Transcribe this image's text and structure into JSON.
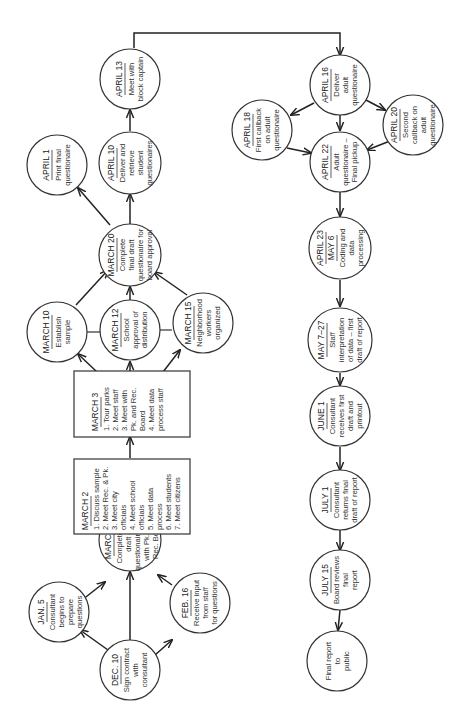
{
  "nodes": {
    "dec10": {
      "date": "DEC. 10",
      "lines": [
        "Sign contract",
        "with",
        "consultant"
      ]
    },
    "jan5": {
      "date": "JAN. 5",
      "lines": [
        "Consultant",
        "begins to",
        "prepare",
        "questions"
      ]
    },
    "feb16": {
      "date": "FEB. 16",
      "lines": [
        "Receive input",
        "from staff",
        "for questions"
      ]
    },
    "march1": {
      "date": "MARCH 1",
      "lines": [
        "Complete first",
        "draft of",
        "questionaire. Meet",
        "with Pk. and",
        "Rec. Board"
      ]
    },
    "march2": {
      "date": "MARCH 2",
      "lines": [
        "1.  Discuss sample",
        "2.  Meet Rec. & Pk.",
        "3.  Meet city",
        "     officials",
        "4.  Meet school",
        "     officials",
        "5.  Meet data",
        "     process",
        "6.  Meet students",
        "7.  Meet citizens"
      ]
    },
    "march3": {
      "date": "MARCH 3",
      "lines": [
        "1.  Tour parks",
        "2.  Meet staff",
        "3.  Meet with",
        "     Pk. and Rec.",
        "     Board",
        "4.  Meet data",
        "     process staff"
      ]
    },
    "march10": {
      "date": "MARCH 10",
      "lines": [
        "Establish",
        "sample"
      ]
    },
    "march12": {
      "date": "MARCH 12",
      "lines": [
        "School",
        "approval of",
        "distribution"
      ]
    },
    "march15": {
      "date": "MARCH 15",
      "lines": [
        "Neighborhood",
        "workers",
        "organized"
      ]
    },
    "march20": {
      "date": "MARCH 20",
      "lines": [
        "Complete",
        "final draft",
        "questionaire for",
        "board approval"
      ]
    },
    "april1": {
      "date": "APRIL 1",
      "lines": [
        "Print final",
        "questionaire"
      ]
    },
    "april10": {
      "date": "APRIL 10",
      "lines": [
        "Deliver and",
        "retrieve",
        "student",
        "questionaires"
      ]
    },
    "april13": {
      "date": "APRIL 13",
      "lines": [
        "Meet with",
        "block captain"
      ]
    },
    "april16": {
      "date": "APRIL 16",
      "lines": [
        "Deliver",
        "adult",
        "questionaire"
      ]
    },
    "april18": {
      "date": "APRIL 18",
      "lines": [
        "First callback",
        "on adult",
        "questionaire"
      ]
    },
    "april20": {
      "date": "APRIL 20",
      "lines": [
        "Second",
        "callback on",
        "adult",
        "questionaire"
      ]
    },
    "april22": {
      "date": "APRIL 22",
      "lines": [
        "Adult",
        "questionaire –",
        "Final pickup"
      ]
    },
    "april23": {
      "date": "APRIL 23",
      "date2": "MAY 6",
      "lines": [
        "Coding and",
        "data",
        "processing"
      ]
    },
    "may7": {
      "date": "MAY 7–27",
      "lines": [
        "Staff",
        "interpretation",
        "of data – first",
        "draft of report"
      ]
    },
    "june1": {
      "date": "JUNE 1",
      "lines": [
        "Consultant",
        "receives first",
        "draft and",
        "printout"
      ]
    },
    "july1": {
      "date": "JULY 1",
      "lines": [
        "Consultant",
        "returns final",
        "draft of report"
      ]
    },
    "july15": {
      "date": "JULY 15",
      "lines": [
        "Board reviews",
        "final",
        "report"
      ]
    },
    "final": {
      "date": "",
      "lines": [
        "Final report",
        "to",
        "public"
      ]
    }
  },
  "edges": [
    [
      "dec10",
      "jan5"
    ],
    [
      "dec10",
      "march1"
    ],
    [
      "dec10",
      "feb16"
    ],
    [
      "jan5",
      "march1"
    ],
    [
      "feb16",
      "march1"
    ],
    [
      "march1",
      "march2"
    ],
    [
      "march2",
      "march3"
    ],
    [
      "march3",
      "march10"
    ],
    [
      "march3",
      "march12"
    ],
    [
      "march3",
      "march15"
    ],
    [
      "march10",
      "march20"
    ],
    [
      "march12",
      "march20"
    ],
    [
      "march15",
      "march20"
    ],
    [
      "march20",
      "april1"
    ],
    [
      "march20",
      "april10"
    ],
    [
      "april10",
      "april13"
    ],
    [
      "april13",
      "april16"
    ],
    [
      "april16",
      "april18"
    ],
    [
      "april16",
      "april20"
    ],
    [
      "april16",
      "april22"
    ],
    [
      "april18",
      "april22"
    ],
    [
      "april20",
      "april22"
    ],
    [
      "april22",
      "april23"
    ],
    [
      "april23",
      "may7"
    ],
    [
      "may7",
      "june1"
    ],
    [
      "june1",
      "july1"
    ],
    [
      "july1",
      "july15"
    ],
    [
      "july15",
      "final"
    ]
  ]
}
